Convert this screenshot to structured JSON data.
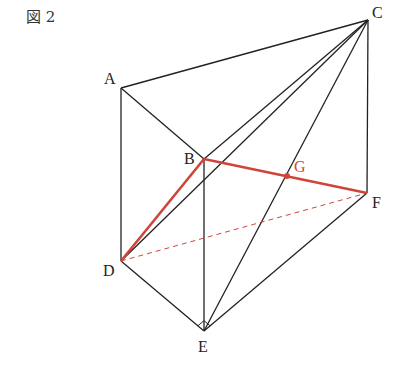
{
  "figure_label": "図 2",
  "colors": {
    "line": "#222222",
    "highlight": "#d0453a"
  },
  "points": {
    "A": {
      "label": "A",
      "x": 121,
      "y": 88
    },
    "B": {
      "label": "B",
      "x": 204,
      "y": 159
    },
    "C": {
      "label": "C",
      "x": 368,
      "y": 20
    },
    "D": {
      "label": "D",
      "x": 121,
      "y": 261
    },
    "E": {
      "label": "E",
      "x": 204,
      "y": 331
    },
    "F": {
      "label": "F",
      "x": 367,
      "y": 193
    },
    "G": {
      "label": "G",
      "x": 287,
      "y": 176
    }
  },
  "edges_black": [
    "AB",
    "AC",
    "BC",
    "AD",
    "BE",
    "CF",
    "DE",
    "EF",
    "CD",
    "CE"
  ],
  "edges_red": [
    "DB",
    "BF"
  ],
  "edges_red_dashed": [
    "DF"
  ],
  "right_angle_at": "E"
}
